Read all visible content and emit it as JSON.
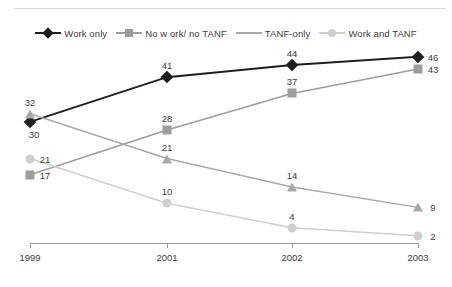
{
  "chart_data": {
    "type": "line",
    "title": "",
    "subtitle": "",
    "xlabel": "",
    "ylabel": "",
    "categories": [
      "1999",
      "2001",
      "2002",
      "2003"
    ],
    "x": [
      1999,
      2001,
      2002,
      2003
    ],
    "ylim": [
      0,
      50
    ],
    "grid": false,
    "legend_position": "top-center",
    "data_labels": true,
    "series": [
      {
        "name": "Work only",
        "marker": "diamond",
        "color": "#1f1f1f",
        "values": [
          30,
          41,
          44,
          46
        ],
        "label_positions": [
          "below",
          "above",
          "above",
          "right"
        ]
      },
      {
        "name": "No w ork/ no TANF",
        "marker": "square",
        "color": "#9d9d9d",
        "values": [
          17,
          28,
          37,
          43
        ],
        "label_positions": [
          "right",
          "above",
          "above",
          "right"
        ]
      },
      {
        "name": "TANF-only",
        "marker": "triangle",
        "color": "#a8a8a8",
        "values": [
          32,
          21,
          14,
          9
        ],
        "label_positions": [
          "above",
          "above",
          "above",
          "right"
        ]
      },
      {
        "name": "Work and TANF",
        "marker": "circle",
        "color": "#cfcfcf",
        "values": [
          21,
          10,
          4,
          2
        ],
        "label_positions": [
          "right",
          "above",
          "above",
          "right"
        ]
      }
    ]
  },
  "axis": {
    "tick_labels": [
      "1999",
      "2001",
      "2002",
      "2003"
    ]
  },
  "legend": {
    "entries": [
      {
        "label": "Work only",
        "marker": "diamond",
        "color": "#1f1f1f"
      },
      {
        "label": "No w ork/ no TANF",
        "marker": "square",
        "color": "#9d9d9d"
      },
      {
        "label": "TANF-only",
        "marker": "triangle",
        "color": "#a8a8a8"
      },
      {
        "label": "Work and TANF",
        "marker": "circle",
        "color": "#cfcfcf"
      }
    ]
  },
  "colors": {
    "work_only": "#1f1f1f",
    "no_work_no_tanf": "#9d9d9d",
    "tanf_only": "#a8a8a8",
    "work_and_tanf": "#cfcfcf",
    "axis": "#9a9a9a",
    "text": "#3c3c3c",
    "background": "#ffffff"
  }
}
